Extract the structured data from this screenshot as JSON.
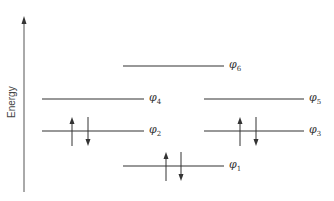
{
  "axis": {
    "label": "Energy",
    "x": 24,
    "y_top": 16,
    "y_bottom": 192
  },
  "orbitals": [
    {
      "name": "phi6",
      "symbol": "φ",
      "sub": "6",
      "x1": 123,
      "x2": 224,
      "y": 66,
      "electrons": 0
    },
    {
      "name": "phi4",
      "symbol": "φ",
      "sub": "4",
      "x1": 42,
      "x2": 144,
      "y": 99,
      "electrons": 0
    },
    {
      "name": "phi5",
      "symbol": "φ",
      "sub": "5",
      "x1": 204,
      "x2": 304,
      "y": 99,
      "electrons": 0
    },
    {
      "name": "phi2",
      "symbol": "φ",
      "sub": "2",
      "x1": 42,
      "x2": 144,
      "y": 131,
      "electrons": 2,
      "up_x": 72,
      "down_x": 88
    },
    {
      "name": "phi3",
      "symbol": "φ",
      "sub": "3",
      "x1": 204,
      "x2": 304,
      "y": 131,
      "electrons": 2,
      "up_x": 240,
      "down_x": 256
    },
    {
      "name": "phi1",
      "symbol": "φ",
      "sub": "1",
      "x1": 123,
      "x2": 224,
      "y": 166,
      "electrons": 2,
      "up_x": 166,
      "down_x": 181
    }
  ],
  "colors": {
    "line": "#333333",
    "axis": "#555555"
  }
}
